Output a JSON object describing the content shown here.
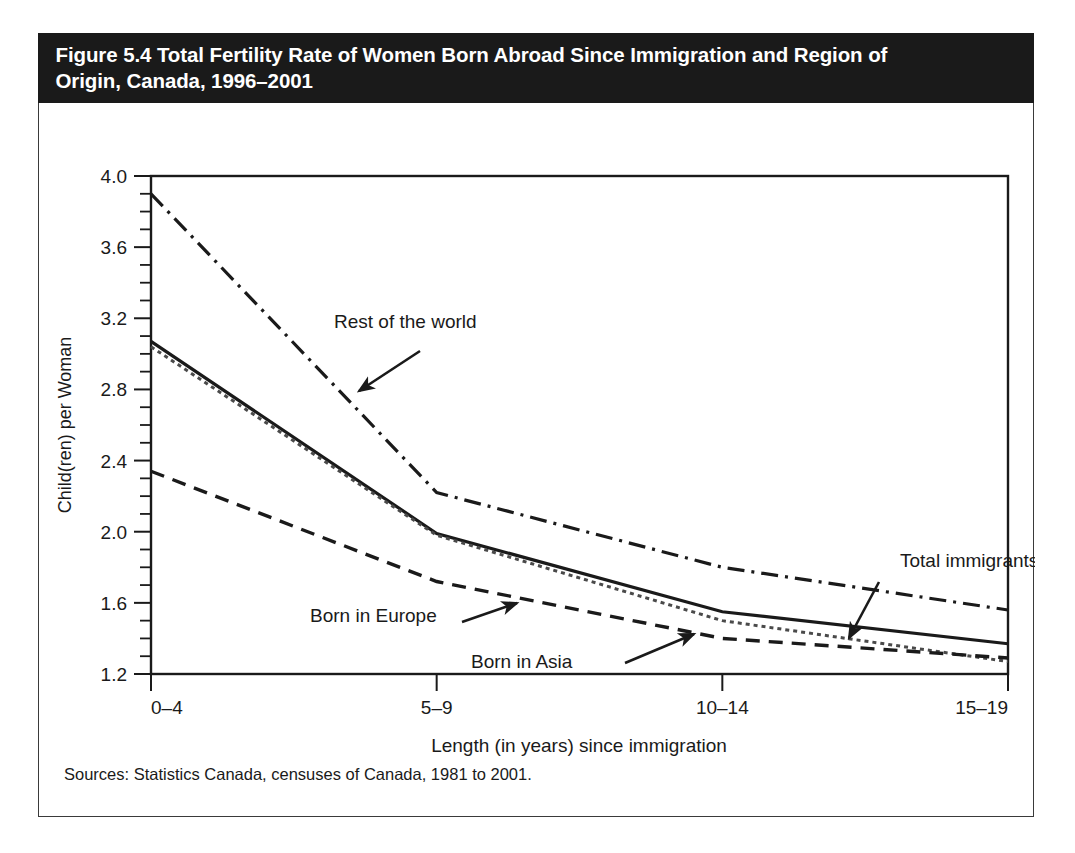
{
  "figure": {
    "title": "Figure 5.4 Total Fertility Rate of Women Born Abroad Since Immigration and Region of\nOrigin, Canada, 1996–2001",
    "sources": "Sources: Statistics Canada, censuses of Canada, 1981 to 2001."
  },
  "chart_data": {
    "type": "line",
    "title": "Figure 5.4 Total Fertility Rate of Women Born Abroad Since Immigration and Region of Origin, Canada, 1996–2001",
    "xlabel": "Length (in years) since immigration",
    "ylabel": "Child(ren) per Woman",
    "categories": [
      "0–4",
      "5–9",
      "10–14",
      "15–19"
    ],
    "ylim": [
      1.2,
      4.0
    ],
    "ytick_labels": [
      "1.2",
      "1.6",
      "2.0",
      "2.4",
      "2.8",
      "3.2",
      "3.6",
      "4.0"
    ],
    "ytick_values": [
      1.2,
      1.6,
      2.0,
      2.4,
      2.8,
      3.2,
      3.6,
      4.0
    ],
    "ytick_minor_step": 0.1,
    "grid": false,
    "legend_position": "inline-annotations",
    "series": [
      {
        "name": "Rest of the world",
        "style": "dash-dot",
        "values": [
          3.9,
          2.22,
          1.8,
          1.56
        ]
      },
      {
        "name": "Total immigrants",
        "style": "solid",
        "values": [
          3.07,
          1.99,
          1.55,
          1.37
        ]
      },
      {
        "name": "Born in Asia",
        "style": "dotted",
        "values": [
          3.04,
          1.98,
          1.5,
          1.27
        ]
      },
      {
        "name": "Born in Europe",
        "style": "dashed",
        "values": [
          2.34,
          1.72,
          1.4,
          1.29
        ]
      }
    ],
    "annotations": [
      {
        "label": "Rest of the world",
        "text_x": 295,
        "text_y": 294,
        "arrow_from_x": 381,
        "arrow_from_y": 317,
        "arrow_to_x": 320,
        "arrow_to_y": 357
      },
      {
        "label": "Total immigrants",
        "text_x": 861,
        "text_y": 533,
        "arrow_from_x": 840,
        "arrow_from_y": 548,
        "arrow_to_x": 809,
        "arrow_to_y": 603
      },
      {
        "label": "Born in Europe",
        "text_x": 271,
        "text_y": 588,
        "arrow_from_x": 342,
        "arrow_from_y": 584,
        "arrow_to_x": 391,
        "arrow_to_y": 570
      },
      {
        "label": "Born in Asia",
        "text_x": 532,
        "text_y": 634,
        "arrow_from_x": 586,
        "arrow_from_y": 627,
        "arrow_to_x": 652,
        "arrow_to_y": 601
      }
    ]
  },
  "axes": {
    "x_categories": [
      "0–4",
      "5–9",
      "10–14",
      "15–19"
    ],
    "x_title": "Length (in years) since immigration",
    "y_title": "Child(ren) per Woman",
    "y_labels": [
      "4.0",
      "3.6",
      "3.2",
      "2.8",
      "2.4",
      "2.0",
      "1.6",
      "1.2"
    ]
  }
}
